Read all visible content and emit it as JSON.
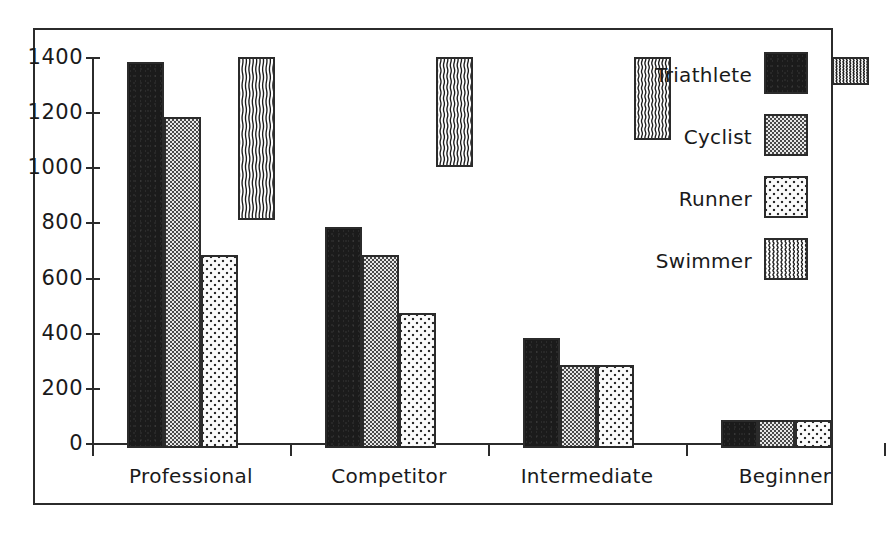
{
  "chart_data": {
    "type": "bar",
    "title": "",
    "xlabel": "",
    "ylabel": "",
    "categories": [
      "Professional",
      "Competitor",
      "Intermediate",
      "Beginner"
    ],
    "series": [
      {
        "name": "Triathlete",
        "pattern": "solid-black",
        "values": [
          1400,
          800,
          400,
          100
        ]
      },
      {
        "name": "Cyclist",
        "pattern": "gray-checker",
        "values": [
          1200,
          700,
          300,
          100
        ]
      },
      {
        "name": "Runner",
        "pattern": "light-dots",
        "values": [
          700,
          490,
          300,
          100
        ]
      },
      {
        "name": "Swimmer",
        "pattern": "wavy-lines",
        "values": [
          590,
          400,
          300,
          100
        ]
      }
    ],
    "ylim": [
      0,
      1400
    ],
    "ytick_labels": [
      "0",
      "200",
      "400",
      "600",
      "800",
      "1000",
      "1200",
      "1400"
    ],
    "ytick_values": [
      0,
      200,
      400,
      600,
      800,
      1000,
      1200,
      1400
    ],
    "grid": false,
    "legend_position": "right",
    "colors": {
      "axis": "#2b2b2b",
      "frame": "#2b2b2b",
      "text": "#1a1a1a",
      "background": "#ffffff",
      "triathlete": "#1b1b1b",
      "cyclist": "#9a9a9a",
      "runner": "#ededed",
      "swimmer": "#ffffff"
    }
  },
  "legend": {
    "items": [
      {
        "label": "Triathlete",
        "swatch_name": "legend-swatch-triathlete"
      },
      {
        "label": "Cyclist",
        "swatch_name": "legend-swatch-cyclist"
      },
      {
        "label": "Runner",
        "swatch_name": "legend-swatch-runner"
      },
      {
        "label": "Swimmer",
        "swatch_name": "legend-swatch-swimmer"
      }
    ]
  }
}
